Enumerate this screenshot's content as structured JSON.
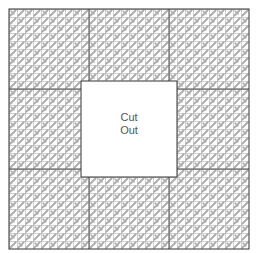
{
  "diagram": {
    "type": "cross-stitch canvas layout",
    "grid": {
      "cells_per_side": 30,
      "major_every": 10
    },
    "cutout": {
      "line1": "Cut",
      "line2": "Out"
    },
    "colors": {
      "stitch": "#b0b0b0",
      "grid": "#8a8a8a",
      "major": "#444444",
      "border": "#333333",
      "text": "#555555"
    }
  }
}
